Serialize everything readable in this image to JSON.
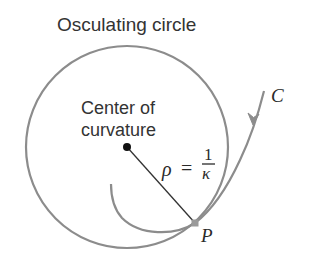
{
  "diagram": {
    "title": "Osculating circle",
    "center_label_line1": "Center of",
    "center_label_line2": "curvature",
    "radius_symbol": "ρ",
    "equals": "=",
    "fraction_numerator": "1",
    "fraction_denominator": "κ",
    "curve_label": "C",
    "point_label": "P",
    "colors": {
      "circle": "#8c8c8c",
      "curve": "#8c8c8c",
      "radius_line": "#333333",
      "center_dot": "#111111",
      "text": "#333333"
    },
    "geometry": {
      "circle_center": [
        127,
        147
      ],
      "circle_radius": 101,
      "point_P": [
        195,
        223
      ]
    }
  }
}
